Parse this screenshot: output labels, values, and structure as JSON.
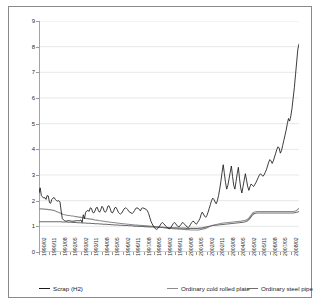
{
  "chart_data": {
    "type": "line",
    "title": "",
    "xlabel": "",
    "ylabel": "",
    "ylim": [
      0,
      9
    ],
    "yticks": [
      0,
      1,
      2,
      3,
      4,
      5,
      6,
      7,
      8,
      9
    ],
    "grid": true,
    "legend_position": "bottom",
    "xtick_labels": [
      "1990/02",
      "1990/11",
      "1991/08",
      "1992/05",
      "1993/02",
      "1993/11",
      "1994/08",
      "1995/05",
      "1996/02",
      "1996/11",
      "1997/08",
      "1998/05",
      "1999/02",
      "1999/11",
      "2000/08",
      "2001/05",
      "2002/02",
      "2002/11",
      "2003/08",
      "2004/05",
      "2005/02",
      "2005/11",
      "2006/08",
      "2007/05",
      "2008/02"
    ],
    "x_start": "1990/02",
    "x_end": "2008/05",
    "x_step_months": 1,
    "series": [
      {
        "name": "Scrap (H2)",
        "color": "#1a1a1a",
        "values": [
          2.3,
          2.5,
          2.2,
          2.15,
          2.1,
          2.12,
          2.05,
          2.2,
          2.18,
          1.92,
          1.9,
          2.05,
          2.1,
          2.12,
          2.05,
          2.0,
          1.98,
          2.0,
          1.95,
          1.6,
          1.3,
          1.25,
          1.22,
          1.2,
          1.21,
          1.22,
          1.22,
          1.21,
          1.2,
          1.2,
          1.2,
          1.21,
          1.22,
          1.22,
          1.22,
          1.22,
          1.25,
          1.15,
          1.45,
          1.3,
          1.55,
          1.6,
          1.62,
          1.58,
          1.72,
          1.7,
          1.55,
          1.52,
          1.6,
          1.72,
          1.74,
          1.6,
          1.55,
          1.65,
          1.78,
          1.72,
          1.58,
          1.55,
          1.62,
          1.78,
          1.8,
          1.7,
          1.55,
          1.52,
          1.6,
          1.72,
          1.74,
          1.66,
          1.55,
          1.5,
          1.48,
          1.52,
          1.6,
          1.68,
          1.72,
          1.7,
          1.66,
          1.58,
          1.55,
          1.52,
          1.5,
          1.55,
          1.62,
          1.7,
          1.72,
          1.7,
          1.66,
          1.6,
          1.7,
          1.72,
          1.7,
          1.68,
          1.66,
          1.6,
          1.5,
          1.35,
          1.2,
          1.1,
          1.02,
          0.95,
          0.9,
          0.88,
          0.92,
          0.98,
          1.05,
          1.12,
          1.15,
          1.1,
          1.05,
          1.0,
          0.95,
          0.92,
          0.9,
          0.95,
          1.02,
          1.1,
          1.15,
          1.12,
          1.05,
          1.0,
          0.98,
          1.02,
          1.08,
          1.15,
          1.12,
          1.08,
          1.02,
          0.98,
          0.95,
          1.0,
          1.08,
          1.15,
          1.2,
          1.18,
          1.12,
          1.08,
          1.15,
          1.22,
          1.3,
          1.45,
          1.55,
          1.48,
          1.4,
          1.35,
          1.42,
          1.55,
          1.7,
          1.85,
          2.0,
          2.1,
          2.05,
          1.95,
          1.88,
          2.0,
          2.2,
          2.45,
          2.75,
          3.1,
          3.4,
          3.05,
          2.7,
          2.45,
          2.6,
          2.85,
          3.1,
          3.35,
          2.95,
          2.6,
          2.45,
          2.75,
          3.05,
          3.3,
          2.85,
          2.5,
          2.3,
          2.55,
          2.8,
          3.05,
          2.8,
          2.55,
          2.4,
          2.55,
          2.65,
          2.6,
          2.55,
          2.62,
          2.7,
          2.8,
          2.9,
          3.0,
          3.05,
          3.0,
          2.95,
          3.0,
          3.1,
          3.2,
          3.35,
          3.5,
          3.6,
          3.55,
          3.45,
          3.55,
          3.7,
          3.85,
          4.0,
          4.1,
          4.05,
          3.85,
          3.95,
          4.15,
          4.35,
          4.55,
          4.75,
          5.0,
          5.2,
          5.1,
          5.3,
          5.6,
          6.0,
          6.4,
          6.9,
          7.4,
          7.9,
          8.1
        ]
      },
      {
        "name": "Ordinary cold rolled plate",
        "color": "#8c8c8c",
        "values": [
          1.68,
          1.68,
          1.68,
          1.68,
          1.67,
          1.67,
          1.66,
          1.66,
          1.65,
          1.65,
          1.64,
          1.64,
          1.62,
          1.62,
          1.6,
          1.58,
          1.56,
          1.54,
          1.52,
          1.5,
          1.48,
          1.46,
          1.45,
          1.44,
          1.43,
          1.42,
          1.42,
          1.41,
          1.4,
          1.4,
          1.39,
          1.38,
          1.38,
          1.37,
          1.36,
          1.36,
          1.35,
          1.34,
          1.33,
          1.32,
          1.31,
          1.3,
          1.3,
          1.29,
          1.28,
          1.28,
          1.27,
          1.26,
          1.25,
          1.24,
          1.24,
          1.23,
          1.22,
          1.22,
          1.21,
          1.2,
          1.2,
          1.19,
          1.18,
          1.18,
          1.17,
          1.16,
          1.16,
          1.15,
          1.15,
          1.14,
          1.14,
          1.13,
          1.12,
          1.12,
          1.11,
          1.11,
          1.1,
          1.1,
          1.09,
          1.09,
          1.08,
          1.08,
          1.07,
          1.07,
          1.06,
          1.06,
          1.05,
          1.05,
          1.05,
          1.04,
          1.04,
          1.04,
          1.03,
          1.03,
          1.03,
          1.02,
          1.02,
          1.02,
          1.01,
          1.01,
          1.0,
          1.0,
          1.0,
          0.99,
          0.99,
          0.98,
          0.98,
          0.97,
          0.97,
          0.96,
          0.96,
          0.95,
          0.95,
          0.94,
          0.94,
          0.93,
          0.93,
          0.92,
          0.92,
          0.91,
          0.91,
          0.9,
          0.9,
          0.9,
          0.89,
          0.89,
          0.89,
          0.88,
          0.88,
          0.88,
          0.87,
          0.87,
          0.87,
          0.87,
          0.86,
          0.86,
          0.86,
          0.86,
          0.86,
          0.86,
          0.86,
          0.86,
          0.87,
          0.88,
          0.89,
          0.9,
          0.91,
          0.92,
          0.94,
          0.96,
          0.98,
          1.0,
          1.02,
          1.04,
          1.05,
          1.06,
          1.07,
          1.08,
          1.09,
          1.1,
          1.11,
          1.12,
          1.13,
          1.13,
          1.14,
          1.14,
          1.15,
          1.15,
          1.16,
          1.16,
          1.17,
          1.17,
          1.18,
          1.18,
          1.19,
          1.19,
          1.2,
          1.2,
          1.21,
          1.22,
          1.23,
          1.24,
          1.26,
          1.28,
          1.32,
          1.38,
          1.44,
          1.5,
          1.54,
          1.56,
          1.57,
          1.58,
          1.58,
          1.58,
          1.58,
          1.58,
          1.58,
          1.58,
          1.58,
          1.58,
          1.58,
          1.58,
          1.58,
          1.58,
          1.58,
          1.58,
          1.58,
          1.58,
          1.58,
          1.58,
          1.58,
          1.58,
          1.58,
          1.58,
          1.58,
          1.58,
          1.58,
          1.58,
          1.58,
          1.58,
          1.58,
          1.58,
          1.58,
          1.59,
          1.6,
          1.62,
          1.66,
          1.7
        ]
      },
      {
        "name": "Ordinary steel pipe",
        "color": "#6e6e6e",
        "values": [
          1.18,
          1.18,
          1.18,
          1.18,
          1.18,
          1.18,
          1.18,
          1.18,
          1.18,
          1.18,
          1.18,
          1.18,
          1.18,
          1.18,
          1.18,
          1.18,
          1.18,
          1.18,
          1.18,
          1.18,
          1.17,
          1.17,
          1.17,
          1.17,
          1.17,
          1.16,
          1.16,
          1.16,
          1.16,
          1.15,
          1.15,
          1.15,
          1.15,
          1.14,
          1.14,
          1.14,
          1.14,
          1.13,
          1.13,
          1.13,
          1.13,
          1.12,
          1.12,
          1.12,
          1.12,
          1.11,
          1.11,
          1.11,
          1.1,
          1.1,
          1.1,
          1.1,
          1.09,
          1.09,
          1.09,
          1.08,
          1.08,
          1.08,
          1.08,
          1.07,
          1.07,
          1.07,
          1.06,
          1.06,
          1.06,
          1.05,
          1.05,
          1.05,
          1.05,
          1.04,
          1.04,
          1.04,
          1.04,
          1.03,
          1.03,
          1.03,
          1.03,
          1.02,
          1.02,
          1.02,
          1.02,
          1.01,
          1.01,
          1.01,
          1.01,
          1.0,
          1.0,
          1.0,
          1.0,
          1.0,
          0.99,
          0.99,
          0.99,
          0.99,
          0.98,
          0.98,
          0.98,
          0.98,
          0.98,
          0.97,
          0.97,
          0.97,
          0.97,
          0.96,
          0.96,
          0.96,
          0.96,
          0.96,
          0.95,
          0.95,
          0.95,
          0.95,
          0.95,
          0.94,
          0.94,
          0.94,
          0.94,
          0.94,
          0.94,
          0.93,
          0.93,
          0.93,
          0.93,
          0.93,
          0.93,
          0.93,
          0.92,
          0.92,
          0.92,
          0.92,
          0.92,
          0.92,
          0.92,
          0.92,
          0.92,
          0.92,
          0.92,
          0.92,
          0.93,
          0.93,
          0.94,
          0.95,
          0.96,
          0.97,
          0.98,
          0.99,
          1.0,
          1.01,
          1.02,
          1.03,
          1.03,
          1.04,
          1.04,
          1.05,
          1.05,
          1.06,
          1.06,
          1.07,
          1.07,
          1.08,
          1.08,
          1.09,
          1.09,
          1.1,
          1.1,
          1.11,
          1.11,
          1.12,
          1.12,
          1.13,
          1.13,
          1.14,
          1.14,
          1.15,
          1.15,
          1.16,
          1.17,
          1.18,
          1.2,
          1.22,
          1.26,
          1.32,
          1.38,
          1.44,
          1.48,
          1.5,
          1.51,
          1.52,
          1.52,
          1.52,
          1.52,
          1.52,
          1.52,
          1.52,
          1.52,
          1.52,
          1.52,
          1.52,
          1.52,
          1.52,
          1.52,
          1.52,
          1.52,
          1.52,
          1.52,
          1.52,
          1.52,
          1.52,
          1.52,
          1.52,
          1.52,
          1.52,
          1.52,
          1.52,
          1.52,
          1.52,
          1.52,
          1.52,
          1.52,
          1.53,
          1.54,
          1.55,
          1.56,
          1.58
        ]
      }
    ]
  },
  "legend": {
    "items": [
      {
        "label": "Scrap (H2)"
      },
      {
        "label": "Ordinary cold rolled plate"
      },
      {
        "label": "Ordinary steel pipe"
      }
    ]
  }
}
